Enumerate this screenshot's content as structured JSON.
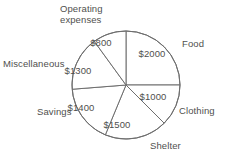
{
  "chart_data": {
    "type": "pie",
    "title": "",
    "currency": "$",
    "total": 8000,
    "categories": [
      "Food",
      "Clothing",
      "Shelter",
      "Savings",
      "Miscellaneous",
      "Operating expenses"
    ],
    "values": [
      2000,
      1000,
      1500,
      1400,
      1300,
      800
    ],
    "value_labels": [
      "$2000",
      "$1000",
      "$1500",
      "$1400",
      "$1300",
      "$800"
    ],
    "start_angle_deg": 0,
    "direction": "clockwise",
    "legend": "none",
    "grid": false,
    "slices": [
      {
        "label": "Food",
        "value_label": "$2000",
        "value": 2000,
        "angle_deg": 90,
        "start_deg": 0,
        "end_deg": 90,
        "value_x": 152,
        "value_y": 57,
        "label_left": 182,
        "label_top": 38
      },
      {
        "label": "Clothing",
        "value_label": "$1000",
        "value": 1000,
        "angle_deg": 45,
        "start_deg": 90,
        "end_deg": 135,
        "value_x": 153,
        "value_y": 100,
        "label_left": 179,
        "label_top": 105
      },
      {
        "label": "Shelter",
        "value_label": "$1500",
        "value": 1500,
        "angle_deg": 67.5,
        "start_deg": 135,
        "end_deg": 202.5,
        "value_x": 117,
        "value_y": 128,
        "label_left": 150,
        "label_top": 140
      },
      {
        "label": "Savings",
        "value_label": "$1400",
        "value": 1400,
        "angle_deg": 63,
        "start_deg": 202.5,
        "end_deg": 265.5,
        "value_x": 81,
        "value_y": 111,
        "label_left": 37,
        "label_top": 106
      },
      {
        "label": "Miscellaneous",
        "value_label": "$1300",
        "value": 1300,
        "angle_deg": 58.5,
        "start_deg": 265.5,
        "end_deg": 324,
        "value_x": 78,
        "value_y": 74,
        "label_left": 3,
        "label_top": 58
      },
      {
        "label": "Operating\nexpenses",
        "value_label": "$800",
        "value": 800,
        "angle_deg": 36,
        "start_deg": 324,
        "end_deg": 360,
        "value_x": 101,
        "value_y": 46,
        "label_left": 60,
        "label_top": 3
      }
    ],
    "geometry": {
      "cx": 126,
      "cy": 85,
      "r": 54
    },
    "colors": {
      "slice_fill": "#ffffff",
      "stroke": "#6e6e6e",
      "text": "#50504e",
      "background": "#ffffff"
    }
  }
}
